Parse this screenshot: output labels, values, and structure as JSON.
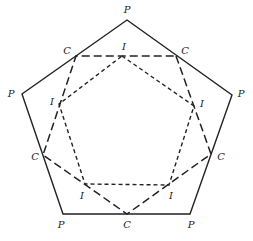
{
  "diagram": {
    "colors": {
      "stroke": "#222222",
      "background": "#ffffff"
    },
    "outer_pentagon": {
      "label": "P",
      "style": "solid",
      "vertices": [
        [
          127,
          20
        ],
        [
          232,
          95
        ],
        [
          190,
          214
        ],
        [
          63,
          214
        ],
        [
          22,
          94
        ]
      ]
    },
    "middle_pentagon": {
      "label": "C",
      "style": "long-dash",
      "vertices": [
        [
          176,
          56
        ],
        [
          211,
          154
        ],
        [
          127,
          214
        ],
        [
          43,
          155
        ],
        [
          76,
          56
        ]
      ]
    },
    "inner_pentagon": {
      "label": "I",
      "style": "short-dash",
      "vertices": [
        [
          122,
          56
        ],
        [
          194,
          106
        ],
        [
          169,
          185
        ],
        [
          85,
          184
        ],
        [
          59,
          104
        ]
      ]
    },
    "labels": [
      {
        "text": "P",
        "x": 127,
        "y": 13
      },
      {
        "text": "P",
        "x": 241,
        "y": 97
      },
      {
        "text": "P",
        "x": 191,
        "y": 228
      },
      {
        "text": "P",
        "x": 61,
        "y": 228
      },
      {
        "text": "P",
        "x": 11,
        "y": 97
      },
      {
        "text": "C",
        "x": 67,
        "y": 54
      },
      {
        "text": "C",
        "x": 185,
        "y": 54
      },
      {
        "text": "C",
        "x": 221,
        "y": 160
      },
      {
        "text": "C",
        "x": 127,
        "y": 228
      },
      {
        "text": "C",
        "x": 35,
        "y": 160
      },
      {
        "text": "I",
        "x": 124,
        "y": 50
      },
      {
        "text": "I",
        "x": 202,
        "y": 107
      },
      {
        "text": "I",
        "x": 171,
        "y": 199
      },
      {
        "text": "I",
        "x": 82,
        "y": 199
      },
      {
        "text": "I",
        "x": 52,
        "y": 105
      }
    ]
  }
}
